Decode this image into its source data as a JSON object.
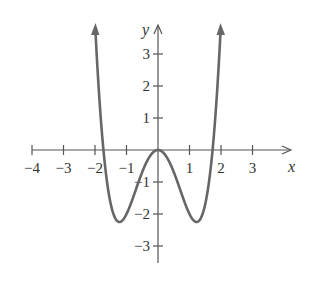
{
  "chart_data": {
    "type": "line",
    "title": "",
    "function": "y = x^4 - 3x^2",
    "xlabel": "x",
    "ylabel": "y",
    "xlim": [
      -4,
      3.8
    ],
    "ylim": [
      -3.5,
      3.8
    ],
    "x_ticks": [
      -4,
      -3,
      -2,
      -1,
      1,
      2,
      3
    ],
    "x_tick_labels": [
      "−4",
      "−3",
      "−2",
      "−1",
      "1",
      "2",
      "3"
    ],
    "y_ticks": [
      3,
      2,
      1,
      -1,
      -2,
      -3
    ],
    "y_tick_labels": [
      "3",
      "2",
      "1",
      "−1",
      "−2",
      "−3"
    ],
    "grid": false,
    "legend": null,
    "series": [
      {
        "name": "curve",
        "color": "#666666",
        "points": [
          [
            -1.98,
            3.92
          ],
          [
            -1.9,
            2.21
          ],
          [
            -1.8,
            0.78
          ],
          [
            -1.73,
            0.0
          ],
          [
            -1.6,
            -1.12
          ],
          [
            -1.4,
            -2.04
          ],
          [
            -1.22,
            -2.25
          ],
          [
            -1.0,
            -2.0
          ],
          [
            -0.8,
            -1.51
          ],
          [
            -0.6,
            -0.95
          ],
          [
            -0.4,
            -0.45
          ],
          [
            -0.2,
            -0.12
          ],
          [
            0.0,
            0.0
          ],
          [
            0.2,
            -0.12
          ],
          [
            0.4,
            -0.45
          ],
          [
            0.6,
            -0.95
          ],
          [
            0.8,
            -1.51
          ],
          [
            1.0,
            -2.0
          ],
          [
            1.22,
            -2.25
          ],
          [
            1.4,
            -2.04
          ],
          [
            1.6,
            -1.12
          ],
          [
            1.73,
            0.0
          ],
          [
            1.8,
            0.78
          ],
          [
            1.9,
            2.21
          ],
          [
            1.98,
            3.92
          ]
        ]
      }
    ],
    "features": {
      "local_max": [
        0,
        0
      ],
      "local_min": [
        [
          -1.22,
          -2.25
        ],
        [
          1.22,
          -2.25
        ]
      ],
      "x_intercepts": [
        -1.73,
        0,
        1.73
      ]
    }
  }
}
